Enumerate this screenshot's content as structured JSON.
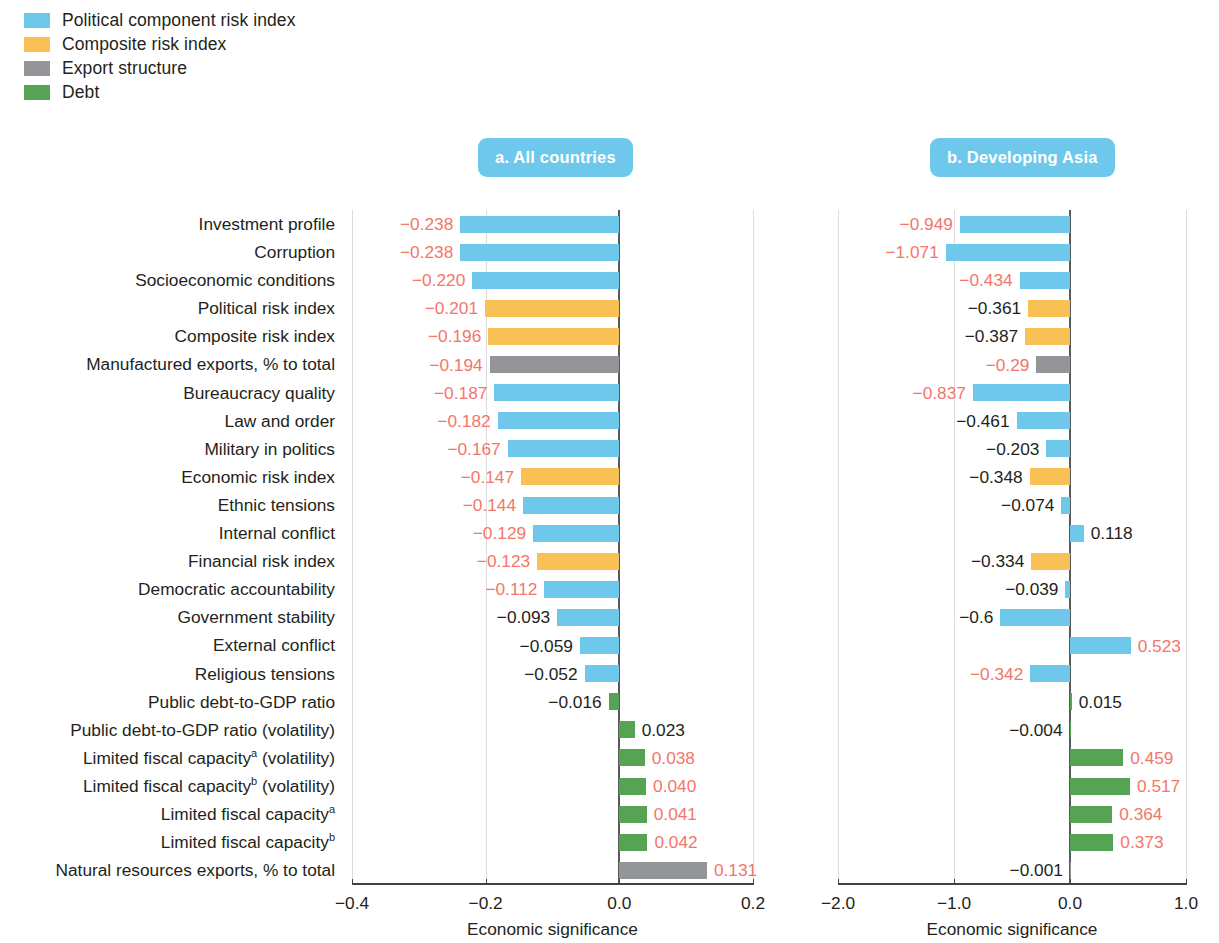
{
  "legend": {
    "items": [
      {
        "label": "Political component risk index",
        "color": "#6dc8ec",
        "key": "political"
      },
      {
        "label": "Composite risk index",
        "color": "#f9c055",
        "key": "composite"
      },
      {
        "label": "Export structure",
        "color": "#949599",
        "key": "export"
      },
      {
        "label": "Debt",
        "color": "#58a councils",
        "key": "debt"
      }
    ]
  },
  "colors": {
    "political": "#6dc8ec",
    "composite": "#f9c055",
    "export": "#949599",
    "debt": "#56a354",
    "significant_text": "#f4766a",
    "nonsignificant_text": "#231f20",
    "badge": "#6dc8ec",
    "axis": "#414042",
    "gridline": "#dcdcdc"
  },
  "panels": [
    {
      "id": "a",
      "badge": "a.  All countries"
    },
    {
      "id": "b",
      "badge": "b.  Developing Asia"
    }
  ],
  "axis_title": "Economic significance",
  "chart_data": {
    "type": "bar",
    "title": "",
    "xlabel": "Economic significance",
    "ylabel": "",
    "orientation": "horizontal",
    "grid": true,
    "legend_position": "top-left",
    "categories": [
      "Investment profile",
      "Corruption",
      "Socioeconomic conditions",
      "Political risk index",
      "Composite risk index",
      "Manufactured exports, % to total",
      "Bureaucracy quality",
      "Law and order",
      "Military in politics",
      "Economic risk index",
      "Ethnic tensions",
      "Internal conflict",
      "Financial risk index",
      "Democratic accountability",
      "Government stability",
      "External conflict",
      "Religious tensions",
      "Public debt-to-GDP ratio",
      "Public debt-to-GDP ratio (volatility)",
      "Limited fiscal capacity@a (volatility)",
      "Limited fiscal capacity@b (volatility)",
      "Limited fiscal capacity@a",
      "Limited fiscal capacity@b",
      "Natural resources exports, % to total"
    ],
    "category_groups": [
      "political",
      "political",
      "political",
      "composite",
      "composite",
      "export",
      "political",
      "political",
      "political",
      "composite",
      "political",
      "political",
      "composite",
      "political",
      "political",
      "political",
      "political",
      "debt",
      "debt",
      "debt",
      "debt",
      "debt",
      "debt",
      "export"
    ],
    "panels": [
      {
        "name": "a. All countries",
        "xlim": [
          -0.4,
          0.2
        ],
        "xticks": [
          -0.4,
          -0.2,
          0.0,
          0.2
        ],
        "xticklabels": [
          "-0.4",
          "-0.2",
          "0.0",
          "0.2"
        ],
        "values": [
          -0.238,
          -0.238,
          -0.22,
          -0.201,
          -0.196,
          -0.194,
          -0.187,
          -0.182,
          -0.167,
          -0.147,
          -0.144,
          -0.129,
          -0.123,
          -0.112,
          -0.093,
          -0.059,
          -0.052,
          -0.016,
          0.023,
          0.038,
          0.04,
          0.041,
          0.042,
          0.131
        ],
        "labels": [
          "−0.238",
          "−0.238",
          "−0.220",
          "−0.201",
          "−0.196",
          "−0.194",
          "−0.187",
          "−0.182",
          "−0.167",
          "−0.147",
          "−0.144",
          "−0.129",
          "−0.123",
          "−0.112",
          "−0.093",
          "−0.059",
          "−0.052",
          "−0.016",
          "0.023",
          "0.038",
          "0.040",
          "0.041",
          "0.042",
          "0.131"
        ],
        "significant": [
          true,
          true,
          true,
          true,
          true,
          true,
          true,
          true,
          true,
          true,
          true,
          true,
          true,
          true,
          false,
          false,
          false,
          false,
          false,
          true,
          true,
          true,
          true,
          true
        ]
      },
      {
        "name": "b. Developing Asia",
        "xlim": [
          -2.0,
          1.0
        ],
        "xticks": [
          -2.0,
          -1.0,
          0.0,
          1.0
        ],
        "xticklabels": [
          "-2.0",
          "-1.0",
          "0.0",
          "1.0"
        ],
        "values": [
          -0.949,
          -1.071,
          -0.434,
          -0.361,
          -0.387,
          -0.29,
          -0.837,
          -0.461,
          -0.203,
          -0.348,
          -0.074,
          0.118,
          -0.334,
          -0.039,
          -0.6,
          0.523,
          -0.342,
          0.015,
          -0.004,
          0.459,
          0.517,
          0.364,
          0.373,
          -0.001
        ],
        "labels": [
          "−0.949",
          "−1.071",
          "−0.434",
          "−0.361",
          "−0.387",
          "−0.29",
          "−0.837",
          "−0.461",
          "−0.203",
          "−0.348",
          "−0.074",
          "0.118",
          "−0.334",
          "−0.039",
          "−0.6",
          "0.523",
          "−0.342",
          "0.015",
          "−0.004",
          "0.459",
          "0.517",
          "0.364",
          "0.373",
          "−0.001"
        ],
        "significant": [
          true,
          true,
          true,
          false,
          false,
          true,
          true,
          false,
          false,
          false,
          false,
          false,
          false,
          false,
          false,
          true,
          true,
          false,
          false,
          true,
          true,
          true,
          true,
          false
        ]
      }
    ]
  }
}
